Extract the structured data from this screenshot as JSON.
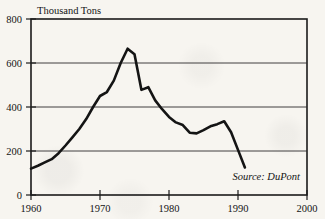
{
  "chart_data": {
    "type": "line",
    "title": "",
    "ylabel": "Thousand Tons",
    "xlabel": "",
    "annotation": "Source: DuPont",
    "xlim": [
      1960,
      2000
    ],
    "ylim": [
      0,
      800
    ],
    "grid": true,
    "legend": "none",
    "y_ticks": [
      "0",
      "200",
      "400",
      "600",
      "800"
    ],
    "y_tick_values": [
      0,
      200,
      400,
      600,
      800
    ],
    "x_ticks": [
      "1960",
      "1970",
      "1980",
      "1990",
      "2000"
    ],
    "x_tick_values": [
      1960,
      1970,
      1980,
      1990,
      2000
    ],
    "series": [
      {
        "name": "Production",
        "x": [
          1960,
          1961,
          1962,
          1963,
          1964,
          1965,
          1966,
          1967,
          1968,
          1969,
          1970,
          1971,
          1972,
          1973,
          1974,
          1975,
          1976,
          1977,
          1978,
          1979,
          1980,
          1981,
          1982,
          1983,
          1984,
          1985,
          1986,
          1987,
          1988,
          1989,
          1990,
          1991
        ],
        "values": [
          120,
          133,
          148,
          163,
          190,
          225,
          262,
          300,
          345,
          400,
          450,
          468,
          520,
          600,
          665,
          640,
          478,
          490,
          430,
          390,
          355,
          330,
          318,
          283,
          280,
          295,
          312,
          322,
          335,
          285,
          205,
          125
        ]
      }
    ]
  }
}
